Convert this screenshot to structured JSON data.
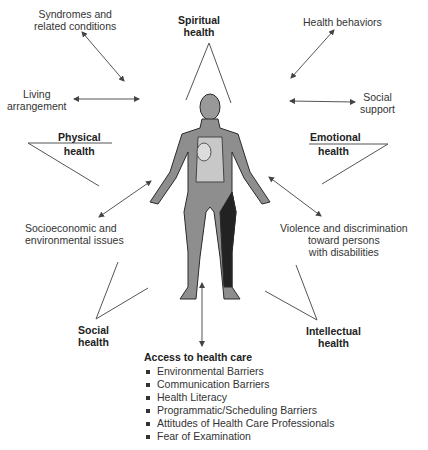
{
  "diagram": {
    "dimensions": {
      "spiritual": {
        "line1": "Spiritual",
        "line2": "health"
      },
      "physical": {
        "line1": "Physical",
        "line2": "health"
      },
      "emotional": {
        "line1": "Emotional",
        "line2": "health"
      },
      "social": {
        "line1": "Social",
        "line2": "health"
      },
      "intellectual": {
        "line1": "Intellectual",
        "line2": "health"
      }
    },
    "factors": {
      "syndromes": {
        "line1": "Syndromes and",
        "line2": "related conditions"
      },
      "living": {
        "line1": "Living",
        "line2": "arrangement"
      },
      "health_behaviors": {
        "line1": "Health behaviors"
      },
      "social_support": {
        "line1": "Social",
        "line2": "support"
      },
      "socioeconomic": {
        "line1": "Socioeconomic and",
        "line2": "environmental issues"
      },
      "violence": {
        "line1": "Violence and discrimination",
        "line2": "toward persons",
        "line3": "with disabilities"
      }
    },
    "access": {
      "title": "Access to health care",
      "items": [
        "Environmental Barriers",
        "Communication Barriers",
        "Health Literacy",
        "Programmatic/Scheduling Barriers",
        "Attitudes of Health Care Professionals",
        "Fear of Examination"
      ]
    },
    "center_image": "human-anatomy-figure"
  }
}
